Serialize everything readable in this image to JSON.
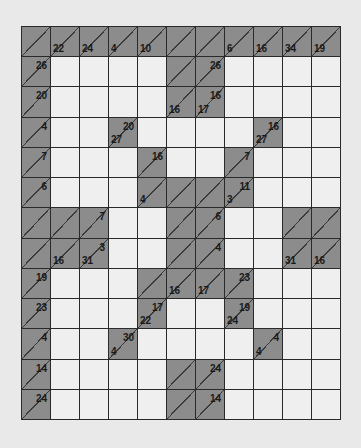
{
  "puzzle": {
    "type": "kakuro",
    "rows": 13,
    "cols": 11,
    "colors": {
      "clue_cell": "#8c8c8c",
      "entry_cell": "#efefef",
      "grid_line": "#2a2a2a",
      "background": "#e9e9e9"
    },
    "grid": [
      [
        {
          "t": "c"
        },
        {
          "t": "c",
          "d": "22"
        },
        {
          "t": "c",
          "d": "24"
        },
        {
          "t": "c",
          "d": "4"
        },
        {
          "t": "c",
          "d": "10"
        },
        {
          "t": "c"
        },
        {
          "t": "c"
        },
        {
          "t": "c",
          "d": "6"
        },
        {
          "t": "c",
          "d": "16"
        },
        {
          "t": "c",
          "d": "34"
        },
        {
          "t": "c",
          "d": "19"
        }
      ],
      [
        {
          "t": "c",
          "a": "26"
        },
        {
          "t": "e"
        },
        {
          "t": "e"
        },
        {
          "t": "e"
        },
        {
          "t": "e"
        },
        {
          "t": "c"
        },
        {
          "t": "c",
          "a": "26"
        },
        {
          "t": "e"
        },
        {
          "t": "e"
        },
        {
          "t": "e"
        },
        {
          "t": "e"
        }
      ],
      [
        {
          "t": "c",
          "a": "20"
        },
        {
          "t": "e"
        },
        {
          "t": "e"
        },
        {
          "t": "e"
        },
        {
          "t": "e"
        },
        {
          "t": "c",
          "d": "16"
        },
        {
          "t": "c",
          "a": "16",
          "d": "17"
        },
        {
          "t": "e"
        },
        {
          "t": "e"
        },
        {
          "t": "e"
        },
        {
          "t": "e"
        }
      ],
      [
        {
          "t": "c",
          "a": "4"
        },
        {
          "t": "e"
        },
        {
          "t": "e"
        },
        {
          "t": "c",
          "a": "20",
          "d": "27"
        },
        {
          "t": "e"
        },
        {
          "t": "e"
        },
        {
          "t": "e"
        },
        {
          "t": "e"
        },
        {
          "t": "c",
          "a": "16",
          "d": "27"
        },
        {
          "t": "e"
        },
        {
          "t": "e"
        }
      ],
      [
        {
          "t": "c",
          "a": "7"
        },
        {
          "t": "e"
        },
        {
          "t": "e"
        },
        {
          "t": "e"
        },
        {
          "t": "c",
          "a": "16"
        },
        {
          "t": "e"
        },
        {
          "t": "e"
        },
        {
          "t": "c",
          "a": "7"
        },
        {
          "t": "e"
        },
        {
          "t": "e"
        },
        {
          "t": "e"
        }
      ],
      [
        {
          "t": "c",
          "a": "6"
        },
        {
          "t": "e"
        },
        {
          "t": "e"
        },
        {
          "t": "e"
        },
        {
          "t": "c",
          "d": "4"
        },
        {
          "t": "c"
        },
        {
          "t": "c"
        },
        {
          "t": "c",
          "a": "11",
          "d": "3"
        },
        {
          "t": "e"
        },
        {
          "t": "e"
        },
        {
          "t": "e"
        }
      ],
      [
        {
          "t": "c"
        },
        {
          "t": "c"
        },
        {
          "t": "c",
          "a": "7"
        },
        {
          "t": "e"
        },
        {
          "t": "e"
        },
        {
          "t": "c"
        },
        {
          "t": "c",
          "a": "6"
        },
        {
          "t": "e"
        },
        {
          "t": "e"
        },
        {
          "t": "c"
        },
        {
          "t": "c"
        }
      ],
      [
        {
          "t": "c"
        },
        {
          "t": "c",
          "d": "16"
        },
        {
          "t": "c",
          "a": "3",
          "d": "31"
        },
        {
          "t": "e"
        },
        {
          "t": "e"
        },
        {
          "t": "c"
        },
        {
          "t": "c",
          "a": "4"
        },
        {
          "t": "e"
        },
        {
          "t": "e"
        },
        {
          "t": "c",
          "d": "31"
        },
        {
          "t": "c",
          "d": "16"
        }
      ],
      [
        {
          "t": "c",
          "a": "19"
        },
        {
          "t": "e"
        },
        {
          "t": "e"
        },
        {
          "t": "e"
        },
        {
          "t": "c"
        },
        {
          "t": "c",
          "d": "16"
        },
        {
          "t": "c",
          "d": "17"
        },
        {
          "t": "c",
          "a": "23"
        },
        {
          "t": "e"
        },
        {
          "t": "e"
        },
        {
          "t": "e"
        }
      ],
      [
        {
          "t": "c",
          "a": "23"
        },
        {
          "t": "e"
        },
        {
          "t": "e"
        },
        {
          "t": "e"
        },
        {
          "t": "c",
          "a": "17",
          "d": "22"
        },
        {
          "t": "e"
        },
        {
          "t": "e"
        },
        {
          "t": "c",
          "a": "19",
          "d": "24"
        },
        {
          "t": "e"
        },
        {
          "t": "e"
        },
        {
          "t": "e"
        }
      ],
      [
        {
          "t": "c",
          "a": "4"
        },
        {
          "t": "e"
        },
        {
          "t": "e"
        },
        {
          "t": "c",
          "a": "30",
          "d": "4"
        },
        {
          "t": "e"
        },
        {
          "t": "e"
        },
        {
          "t": "e"
        },
        {
          "t": "e"
        },
        {
          "t": "c",
          "a": "4",
          "d": "4"
        },
        {
          "t": "e"
        },
        {
          "t": "e"
        }
      ],
      [
        {
          "t": "c",
          "a": "14"
        },
        {
          "t": "e"
        },
        {
          "t": "e"
        },
        {
          "t": "e"
        },
        {
          "t": "e"
        },
        {
          "t": "c"
        },
        {
          "t": "c",
          "a": "24"
        },
        {
          "t": "e"
        },
        {
          "t": "e"
        },
        {
          "t": "e"
        },
        {
          "t": "e"
        }
      ],
      [
        {
          "t": "c",
          "a": "24"
        },
        {
          "t": "e"
        },
        {
          "t": "e"
        },
        {
          "t": "e"
        },
        {
          "t": "e"
        },
        {
          "t": "c"
        },
        {
          "t": "c",
          "a": "14"
        },
        {
          "t": "e"
        },
        {
          "t": "e"
        },
        {
          "t": "e"
        },
        {
          "t": "e"
        }
      ]
    ]
  }
}
